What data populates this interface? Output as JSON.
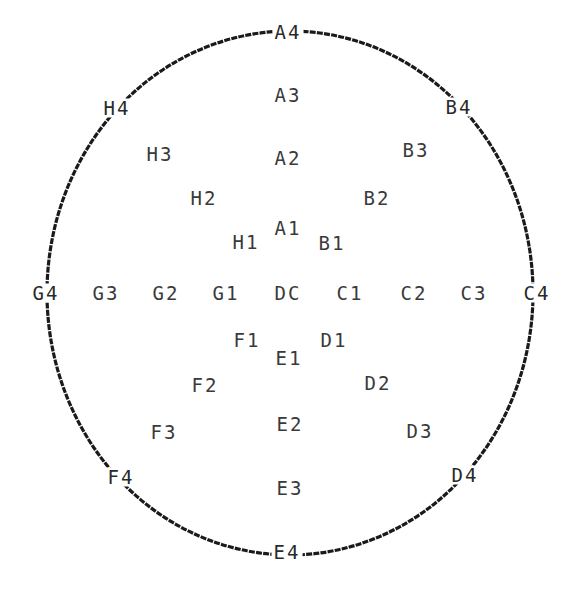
{
  "diagram": {
    "outline": {
      "shape": "ellipse",
      "cx": 290,
      "cy": 293,
      "rx": 243,
      "ry": 262,
      "color": "#1a1a1a"
    },
    "center": {
      "label": "DC",
      "x": 288,
      "y": 293
    },
    "labels": [
      {
        "id": "A4",
        "x": 288,
        "y": 32,
        "rim": true
      },
      {
        "id": "A3",
        "x": 288,
        "y": 95
      },
      {
        "id": "A2",
        "x": 288,
        "y": 158
      },
      {
        "id": "A1",
        "x": 288,
        "y": 228
      },
      {
        "id": "B1",
        "x": 332,
        "y": 243
      },
      {
        "id": "B2",
        "x": 377,
        "y": 198
      },
      {
        "id": "B3",
        "x": 416,
        "y": 150
      },
      {
        "id": "B4",
        "x": 459,
        "y": 107,
        "rim": true
      },
      {
        "id": "C1",
        "x": 350,
        "y": 293
      },
      {
        "id": "C2",
        "x": 414,
        "y": 293
      },
      {
        "id": "C3",
        "x": 474,
        "y": 293
      },
      {
        "id": "C4",
        "x": 537,
        "y": 293,
        "rim": true
      },
      {
        "id": "D1",
        "x": 334,
        "y": 340
      },
      {
        "id": "D2",
        "x": 378,
        "y": 383
      },
      {
        "id": "D3",
        "x": 420,
        "y": 431
      },
      {
        "id": "D4",
        "x": 465,
        "y": 475,
        "rim": true
      },
      {
        "id": "E1",
        "x": 289,
        "y": 358
      },
      {
        "id": "E2",
        "x": 290,
        "y": 424
      },
      {
        "id": "E3",
        "x": 290,
        "y": 488
      },
      {
        "id": "E4",
        "x": 287,
        "y": 552,
        "rim": true
      },
      {
        "id": "F1",
        "x": 247,
        "y": 340
      },
      {
        "id": "F2",
        "x": 205,
        "y": 385
      },
      {
        "id": "F3",
        "x": 164,
        "y": 432
      },
      {
        "id": "F4",
        "x": 121,
        "y": 477,
        "rim": true
      },
      {
        "id": "G1",
        "x": 226,
        "y": 293
      },
      {
        "id": "G2",
        "x": 166,
        "y": 293
      },
      {
        "id": "G3",
        "x": 106,
        "y": 293
      },
      {
        "id": "G4",
        "x": 46,
        "y": 293,
        "rim": true
      },
      {
        "id": "H1",
        "x": 246,
        "y": 242
      },
      {
        "id": "H2",
        "x": 204,
        "y": 198
      },
      {
        "id": "H3",
        "x": 160,
        "y": 154
      },
      {
        "id": "H4",
        "x": 117,
        "y": 108,
        "rim": true
      }
    ]
  }
}
